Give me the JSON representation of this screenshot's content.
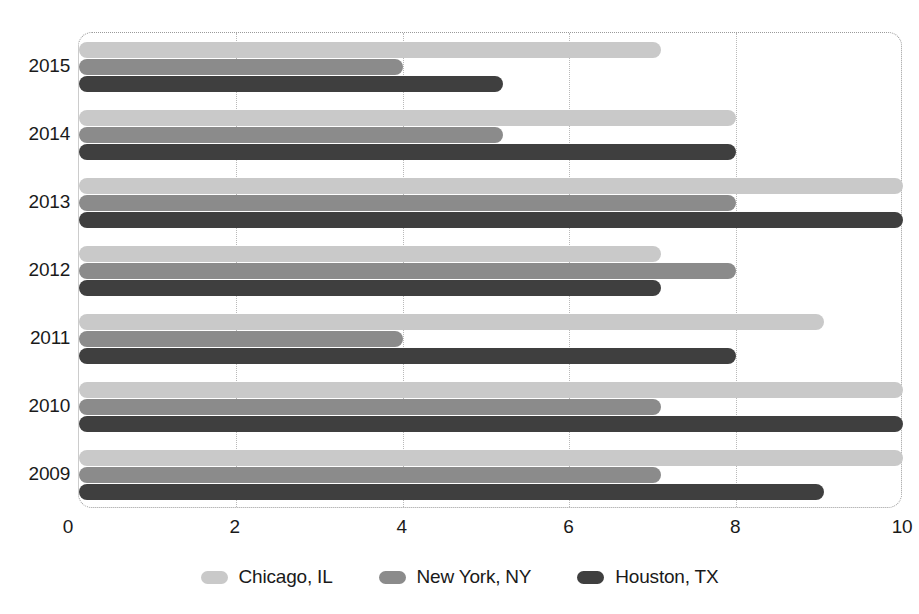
{
  "chart_data": {
    "type": "bar",
    "orientation": "horizontal",
    "title": "",
    "subtitle": "",
    "xlabel": "",
    "ylabel": "",
    "xlim": [
      0,
      10
    ],
    "ylim": null,
    "xticks": [
      "0",
      "2",
      "4",
      "6",
      "8",
      "10"
    ],
    "xtick_values": [
      0,
      2,
      4,
      6,
      8,
      10
    ],
    "grid": true,
    "grid_axis": "x",
    "legend_position": "bottom",
    "categories": [
      "2015",
      "2014",
      "2013",
      "2012",
      "2011",
      "2010",
      "2009"
    ],
    "series": [
      {
        "name": "Chicago, IL",
        "color": "#c9c9c9",
        "values": [
          7.1,
          8.0,
          10.0,
          7.1,
          9.05,
          10.0,
          10.0
        ]
      },
      {
        "name": "New York, NY",
        "color": "#8b8b8b",
        "values": [
          4.0,
          5.2,
          8.0,
          8.0,
          4.0,
          7.1,
          7.1
        ]
      },
      {
        "name": "Houston, TX",
        "color": "#3f3f3f",
        "values": [
          5.2,
          8.0,
          10.0,
          7.1,
          8.0,
          10.0,
          9.05
        ]
      }
    ],
    "annotations": []
  },
  "legend": {
    "items": [
      {
        "label": "Chicago, IL",
        "swatch": "legend-swatch-chicago"
      },
      {
        "label": "New York, NY",
        "swatch": "legend-swatch-new-york"
      },
      {
        "label": "Houston, TX",
        "swatch": "legend-swatch-houston"
      }
    ]
  }
}
